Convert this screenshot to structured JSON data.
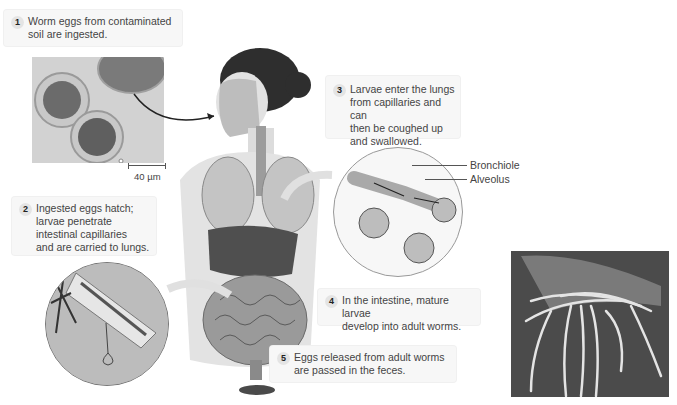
{
  "figure": {
    "steps": [
      {
        "number": "1",
        "text": "Worm eggs from contaminated\nsoil are ingested."
      },
      {
        "number": "2",
        "text": "Ingested eggs hatch;\nlarvae penetrate\nintestinal capillaries\nand are carried to lungs."
      },
      {
        "number": "3",
        "text": "Larvae enter the lungs\nfrom capillaries and can\nthen be coughed up\nand swallowed."
      },
      {
        "number": "4",
        "text": "In the intestine, mature larvae\ndevelop into adult worms."
      },
      {
        "number": "5",
        "text": "Eggs released from adult worms\nare passed in the feces."
      }
    ],
    "labels": {
      "bronchiole": "Bronchiole",
      "alveolus": "Alveolus",
      "scale_bar": "40 µm"
    },
    "images": {
      "eggs_micrograph": "micrograph of worm eggs",
      "human_body": "illustration of human body with lungs and intestines",
      "lung_detail": "magnified bronchiole and alveoli",
      "intestine_detail": "magnified intestinal villus with larva",
      "worms_photo": "photo of adult worms in hand"
    }
  }
}
